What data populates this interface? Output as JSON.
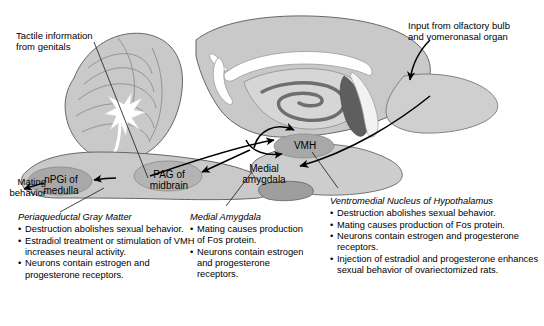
{
  "figure": {
    "type": "neuroanatomy-diagram"
  },
  "colors": {
    "brain_fill": "#c9c9c9",
    "brain_fill_light": "#d8d8d8",
    "nucleus_fill": "#a8a8a8",
    "white_matter": "#ffffff",
    "hippocampus_dark": "#6e6e6e",
    "outline": "#555555",
    "arrow": "#000000",
    "text": "#000000"
  },
  "annotations": {
    "tactile_input": "Tactile information\nfrom genitals",
    "olfactory_input": "Input from olfactory bulb\nand vomeronasal organ",
    "mating_output": "Mating\nbehavior"
  },
  "nuclei": [
    {
      "id": "npgi",
      "label": "nPGi of\nmedulla"
    },
    {
      "id": "pag",
      "label": "PAG of\nmidbrain"
    },
    {
      "id": "medamyg",
      "label": "Medial\namygdala"
    },
    {
      "id": "vmh",
      "label": "VMH"
    }
  ],
  "text_blocks": [
    {
      "id": "pag-block",
      "title": "Periaqueductal Gray Matter",
      "bullets": [
        "Destruction abolishes sexual behavior.",
        "Estradiol treatment or stimulation of VMH increases neural activity.",
        "Neurons contain estrogen and progesterone receptors."
      ]
    },
    {
      "id": "amygdala-block",
      "title": "Medial Amygdala",
      "bullets": [
        "Mating causes production of Fos protein.",
        "Neurons contain estrogen and progesterone receptors."
      ]
    },
    {
      "id": "vmh-block",
      "title": "Ventromedial Nucleus of Hypothalamus",
      "bullets": [
        "Destruction abolishes sexual behavior.",
        "Mating causes production of Fos protein.",
        "Neurons contain estrogen and progesterone receptors.",
        "Injection of estradiol and progesterone enhances sexual behavior of ovariectomized rats."
      ]
    }
  ],
  "icons": {
    "leader_line": "leader-line-icon",
    "connection_arrow": "connection-arrow-icon"
  }
}
